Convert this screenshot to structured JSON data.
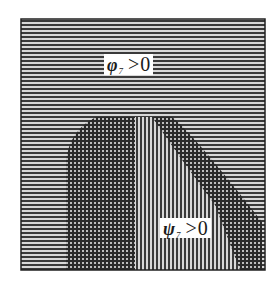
{
  "diagram": {
    "type": "region-diagram",
    "frame": {
      "x": 21,
      "y": 19,
      "width": 244,
      "height": 251
    },
    "colors": {
      "background": "#ffffff",
      "hatch_line": "#3a3a3a",
      "frame": "#222222",
      "label_bg": "#ffffff"
    },
    "regions": [
      {
        "name": "phi-only",
        "hatch": "horizontal",
        "description": "background region where phi_7 > 0"
      },
      {
        "name": "psi-only",
        "hatch": "vertical",
        "description": "central strip where psi_7 > 0"
      },
      {
        "name": "overlap",
        "hatch": "cross",
        "description": "dome-shaped regions where both hold"
      }
    ],
    "labels": {
      "phi": {
        "symbol": "φ",
        "subscript": "7",
        "relation": ">",
        "value": "0"
      },
      "psi": {
        "symbol": "ψ",
        "subscript": "7",
        "relation": ">",
        "value": "0"
      }
    }
  }
}
